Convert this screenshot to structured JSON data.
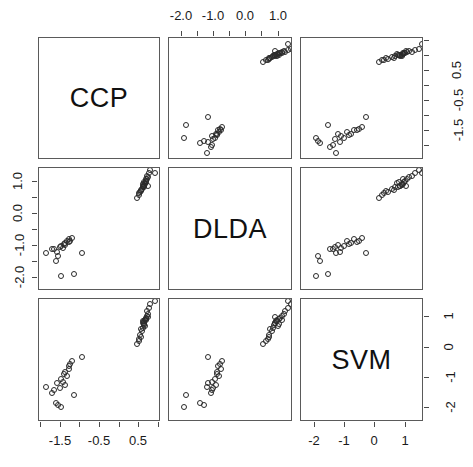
{
  "figure": {
    "type": "scatterplot-matrix",
    "variables": [
      "CCP",
      "DLDA",
      "SVM"
    ],
    "background": "#ffffff",
    "frame_color": "#5a5a5a",
    "point_color": "#2a2a2a",
    "point_symbol": "open-circle"
  },
  "diagonal": {
    "labels": [
      "CCP",
      "DLDA",
      "SVM"
    ]
  },
  "axes": {
    "CCP": {
      "range": [
        -2.05,
        1.05
      ],
      "ticks": [
        -1.5,
        -0.5,
        0.5
      ],
      "minor_ticks": [
        -2.0,
        -1.5,
        -1.0,
        -0.5,
        0.0,
        0.5,
        1.0
      ],
      "tick_labels": [
        "-1.5",
        "-0.5",
        "0.5"
      ],
      "position_bottom": "column-1",
      "position_right": "row-1-right-shows-SVM"
    },
    "DLDA": {
      "range": [
        -2.4,
        1.45
      ],
      "ticks": [
        -2.0,
        -1.0,
        0.0,
        1.0
      ],
      "minor_ticks": [
        -2.0,
        -1.5,
        -1.0,
        -0.5,
        0.0,
        0.5,
        1.0
      ],
      "tick_labels": [
        "-2.0",
        "-1.0",
        "0.0",
        "1.0"
      ],
      "position_top": "column-2",
      "position_left": "row-2"
    },
    "SVM": {
      "range": [
        -2.45,
        1.6
      ],
      "ticks": [
        -2,
        -1,
        0,
        1
      ],
      "tick_labels": [
        "-2",
        "-1",
        "0",
        "1"
      ],
      "position_bottom": "column-3",
      "position_right": "row-3"
    }
  },
  "chart_data": {
    "type": "scatter",
    "title": "",
    "xlabel": "",
    "ylabel": "",
    "variables": [
      "CCP",
      "DLDA",
      "SVM"
    ],
    "matrix_layout": "3x3 pairs plot, variable names on the diagonal",
    "axis_ranges": {
      "CCP": [
        -2.05,
        1.05
      ],
      "DLDA": [
        -2.4,
        1.45
      ],
      "SVM": [
        -2.45,
        1.6
      ]
    },
    "axis_ticks": {
      "CCP": [
        -1.5,
        -0.5,
        0.5
      ],
      "DLDA": [
        -2.0,
        -1.0,
        0.0,
        1.0
      ],
      "SVM": [
        -2,
        -1,
        0,
        1
      ]
    },
    "grid": false,
    "legend": "none",
    "n_points": 46,
    "points": [
      {
        "CCP": 0.62,
        "DLDA": 1.02,
        "SVM": 0.78
      },
      {
        "CCP": 0.58,
        "DLDA": 0.94,
        "SVM": 0.86
      },
      {
        "CCP": 0.67,
        "DLDA": 1.1,
        "SVM": 0.92
      },
      {
        "CCP": 0.72,
        "DLDA": 0.88,
        "SVM": 1.02
      },
      {
        "CCP": 0.55,
        "DLDA": 0.75,
        "SVM": 0.6
      },
      {
        "CCP": 0.64,
        "DLDA": 0.98,
        "SVM": 0.7
      },
      {
        "CCP": 0.7,
        "DLDA": 1.2,
        "SVM": 1.2
      },
      {
        "CCP": 0.48,
        "DLDA": 0.66,
        "SVM": 0.28
      },
      {
        "CCP": 0.6,
        "DLDA": 0.9,
        "SVM": 0.82
      },
      {
        "CCP": 0.66,
        "DLDA": 1.05,
        "SVM": 0.96
      },
      {
        "CCP": 0.74,
        "DLDA": 1.3,
        "SVM": 1.3
      },
      {
        "CCP": 0.52,
        "DLDA": 0.7,
        "SVM": 0.42
      },
      {
        "CCP": 0.63,
        "DLDA": 0.92,
        "SVM": 0.88
      },
      {
        "CCP": 0.69,
        "DLDA": 1.12,
        "SVM": 1.05
      },
      {
        "CCP": 0.57,
        "DLDA": 0.8,
        "SVM": 0.55
      },
      {
        "CCP": 0.61,
        "DLDA": 0.86,
        "SVM": 0.74
      },
      {
        "CCP": 0.76,
        "DLDA": 1.38,
        "SVM": 1.45
      },
      {
        "CCP": 0.45,
        "DLDA": 0.52,
        "SVM": 0.12
      },
      {
        "CCP": 0.65,
        "DLDA": 0.96,
        "SVM": 0.9
      },
      {
        "CCP": 0.59,
        "DLDA": 0.84,
        "SVM": 0.66
      },
      {
        "CCP": 0.71,
        "DLDA": 1.16,
        "SVM": 1.1
      },
      {
        "CCP": 0.5,
        "DLDA": 0.6,
        "SVM": 0.22
      },
      {
        "CCP": 0.68,
        "DLDA": 1.0,
        "SVM": 0.94
      },
      {
        "CCP": 0.54,
        "DLDA": 0.72,
        "SVM": 0.34
      },
      {
        "CCP": 0.62,
        "DLDA": 0.89,
        "SVM": 0.8
      },
      {
        "CCP": 0.9,
        "DLDA": 1.28,
        "SVM": 1.52
      },
      {
        "CCP": -1.42,
        "DLDA": -0.92,
        "SVM": -0.88
      },
      {
        "CCP": -1.52,
        "DLDA": -1.02,
        "SVM": -1.34
      },
      {
        "CCP": -1.35,
        "DLDA": -0.85,
        "SVM": -0.95
      },
      {
        "CCP": -1.6,
        "DLDA": -1.18,
        "SVM": -1.18
      },
      {
        "CCP": -1.48,
        "DLDA": -0.98,
        "SVM": -1.05
      },
      {
        "CCP": -1.28,
        "DLDA": -0.78,
        "SVM": -0.7
      },
      {
        "CCP": -1.72,
        "DLDA": -1.1,
        "SVM": -1.48
      },
      {
        "CCP": -1.4,
        "DLDA": -0.95,
        "SVM": -1.22
      },
      {
        "CCP": -1.3,
        "DLDA": -0.88,
        "SVM": -0.62
      },
      {
        "CCP": -1.56,
        "DLDA": -1.32,
        "SVM": -1.9
      },
      {
        "CCP": -1.22,
        "DLDA": -0.74,
        "SVM": -0.45
      },
      {
        "CCP": -1.45,
        "DLDA": -1.05,
        "SVM": -1.12
      },
      {
        "CCP": -1.88,
        "DLDA": -1.22,
        "SVM": -1.3
      },
      {
        "CCP": -1.38,
        "DLDA": -0.9,
        "SVM": -0.82
      },
      {
        "CCP": -1.62,
        "DLDA": -1.45,
        "SVM": -1.82
      },
      {
        "CCP": -1.15,
        "DLDA": -1.88,
        "SVM": -1.55
      },
      {
        "CCP": -1.5,
        "DLDA": -1.92,
        "SVM": -1.95
      },
      {
        "CCP": -0.95,
        "DLDA": -1.2,
        "SVM": -0.3
      },
      {
        "CCP": -1.68,
        "DLDA": -1.08,
        "SVM": -1.4
      },
      {
        "CCP": -1.25,
        "DLDA": -0.82,
        "SVM": -0.55
      }
    ]
  }
}
